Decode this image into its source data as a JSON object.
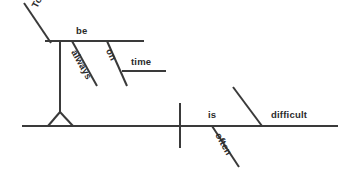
{
  "diagram": {
    "type": "reed-kellogg-sentence-diagram",
    "sentence": "To be always on time is often difficult.",
    "ink_color": "#3a3a3a",
    "background_color": "#ffffff",
    "labels": {
      "to": "To",
      "be": "be",
      "always": "always",
      "on": "on",
      "time": "time",
      "is": "is",
      "often": "often",
      "difficult": "difficult"
    },
    "parts": [
      {
        "word": "To",
        "role": "infinitive-marker",
        "placement": "diagonal-ascending"
      },
      {
        "word": "be",
        "role": "infinitive-verb",
        "placement": "horizontal-baseline"
      },
      {
        "word": "always",
        "role": "adverb",
        "placement": "diagonal-descending"
      },
      {
        "word": "on",
        "role": "preposition",
        "placement": "diagonal-descending"
      },
      {
        "word": "time",
        "role": "object-of-preposition",
        "placement": "horizontal-baseline"
      },
      {
        "word": "is",
        "role": "linking-verb",
        "placement": "main-baseline"
      },
      {
        "word": "often",
        "role": "adverb",
        "placement": "diagonal-descending"
      },
      {
        "word": "difficult",
        "role": "predicate-adjective",
        "placement": "main-baseline"
      }
    ]
  }
}
